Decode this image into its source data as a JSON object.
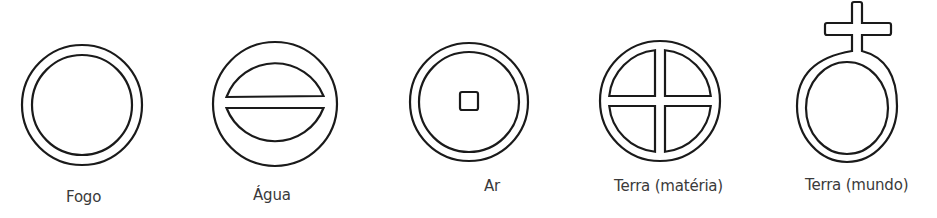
{
  "diagram": {
    "type": "alchemical-element-symbols",
    "stroke_color": "#1a1a1a",
    "label_color": "#3a3a3a",
    "symbols": [
      {
        "name": "fogo",
        "label": "Fogo",
        "shape": "double-circle"
      },
      {
        "name": "agua",
        "label": "Água",
        "shape": "double-circle-horizontal-bar"
      },
      {
        "name": "ar",
        "label": "Ar",
        "shape": "double-circle-center-square"
      },
      {
        "name": "terra-materia",
        "label": "Terra (matéria)",
        "shape": "double-circle-cross"
      },
      {
        "name": "terra-mundo",
        "label": "Terra (mundo)",
        "shape": "double-circle-with-top-cross"
      }
    ]
  }
}
